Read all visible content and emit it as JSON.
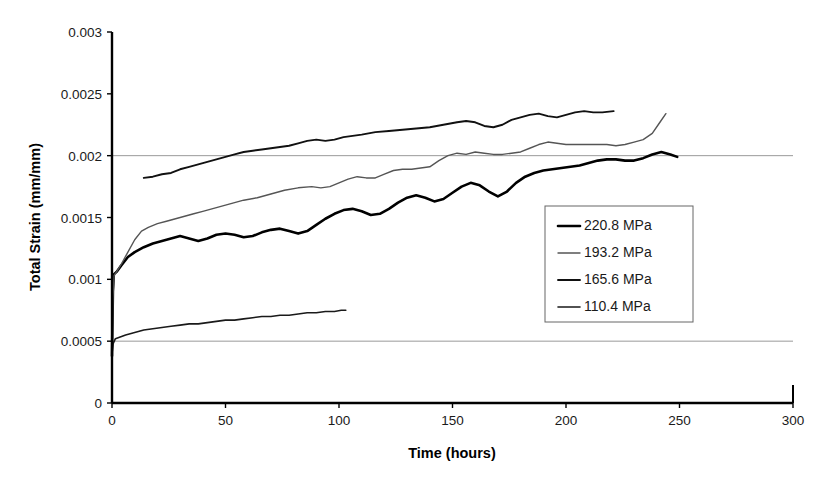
{
  "chart_data": {
    "type": "line",
    "title": "",
    "xlabel": "Time (hours)",
    "ylabel": "Total Strain (mm/mm)",
    "xlim": [
      0,
      300
    ],
    "ylim": [
      0,
      0.003
    ],
    "xticks": [
      0,
      50,
      100,
      150,
      200,
      250,
      300
    ],
    "xtick_labels": [
      "0",
      "50",
      "100",
      "150",
      "200",
      "250",
      "300"
    ],
    "yticks": [
      0,
      0.0005,
      0.001,
      0.0015,
      0.002,
      0.0025,
      0.003
    ],
    "ytick_labels": [
      "0",
      "0.0005",
      "0.001",
      "0.0015",
      "0.002",
      "0.0025",
      "0.003"
    ],
    "grid": "horizontal gridlines at 0.0005 and 0.002 only",
    "grid_values": [
      0.0005,
      0.002
    ],
    "legend_position": "inside lower-right",
    "series": [
      {
        "name": "220.8 MPa",
        "color": "#000000",
        "width": 2.6,
        "points": [
          [
            0,
            0.00038
          ],
          [
            0.4,
            0.0009
          ],
          [
            0.8,
            0.00104
          ],
          [
            2,
            0.00106
          ],
          [
            4,
            0.00111
          ],
          [
            7,
            0.00118
          ],
          [
            10,
            0.00122
          ],
          [
            14,
            0.00126
          ],
          [
            18,
            0.00129
          ],
          [
            22,
            0.00131
          ],
          [
            26,
            0.00133
          ],
          [
            30,
            0.00135
          ],
          [
            34,
            0.00133
          ],
          [
            38,
            0.00131
          ],
          [
            42,
            0.00133
          ],
          [
            46,
            0.00136
          ],
          [
            50,
            0.00137
          ],
          [
            54,
            0.00136
          ],
          [
            58,
            0.00134
          ],
          [
            62,
            0.00135
          ],
          [
            66,
            0.00138
          ],
          [
            70,
            0.0014
          ],
          [
            74,
            0.00141
          ],
          [
            78,
            0.00139
          ],
          [
            82,
            0.00137
          ],
          [
            86,
            0.00139
          ],
          [
            90,
            0.00144
          ],
          [
            94,
            0.00149
          ],
          [
            98,
            0.00153
          ],
          [
            102,
            0.00156
          ],
          [
            106,
            0.00157
          ],
          [
            110,
            0.00155
          ],
          [
            114,
            0.00152
          ],
          [
            118,
            0.00153
          ],
          [
            122,
            0.00157
          ],
          [
            126,
            0.00162
          ],
          [
            130,
            0.00166
          ],
          [
            134,
            0.00168
          ],
          [
            138,
            0.00166
          ],
          [
            142,
            0.00163
          ],
          [
            146,
            0.00165
          ],
          [
            150,
            0.0017
          ],
          [
            154,
            0.00175
          ],
          [
            158,
            0.00178
          ],
          [
            162,
            0.00176
          ],
          [
            166,
            0.00171
          ],
          [
            170,
            0.00167
          ],
          [
            174,
            0.00171
          ],
          [
            178,
            0.00178
          ],
          [
            182,
            0.00183
          ],
          [
            186,
            0.00186
          ],
          [
            190,
            0.00188
          ],
          [
            194,
            0.00189
          ],
          [
            198,
            0.0019
          ],
          [
            202,
            0.00191
          ],
          [
            206,
            0.00192
          ],
          [
            210,
            0.00194
          ],
          [
            214,
            0.00196
          ],
          [
            218,
            0.00197
          ],
          [
            222,
            0.00197
          ],
          [
            226,
            0.00196
          ],
          [
            230,
            0.00196
          ],
          [
            234,
            0.00198
          ],
          [
            238,
            0.00201
          ],
          [
            242,
            0.00203
          ],
          [
            246,
            0.00201
          ],
          [
            249,
            0.00199
          ]
        ]
      },
      {
        "name": "193.2 MPa",
        "color": "#555555",
        "width": 1.4,
        "points": [
          [
            0,
            0.00035
          ],
          [
            0.4,
            0.00085
          ],
          [
            0.9,
            0.00103
          ],
          [
            2,
            0.00106
          ],
          [
            4,
            0.00112
          ],
          [
            7,
            0.00122
          ],
          [
            10,
            0.00132
          ],
          [
            13,
            0.00139
          ],
          [
            16,
            0.00142
          ],
          [
            20,
            0.00145
          ],
          [
            24,
            0.00147
          ],
          [
            28,
            0.00149
          ],
          [
            32,
            0.00151
          ],
          [
            36,
            0.00153
          ],
          [
            40,
            0.00155
          ],
          [
            46,
            0.00158
          ],
          [
            52,
            0.00161
          ],
          [
            58,
            0.00164
          ],
          [
            64,
            0.00166
          ],
          [
            70,
            0.00169
          ],
          [
            76,
            0.00172
          ],
          [
            82,
            0.00174
          ],
          [
            88,
            0.00175
          ],
          [
            92,
            0.00174
          ],
          [
            96,
            0.00175
          ],
          [
            100,
            0.00178
          ],
          [
            104,
            0.00181
          ],
          [
            108,
            0.00183
          ],
          [
            112,
            0.00182
          ],
          [
            116,
            0.00182
          ],
          [
            120,
            0.00185
          ],
          [
            124,
            0.00188
          ],
          [
            128,
            0.00189
          ],
          [
            132,
            0.00189
          ],
          [
            136,
            0.0019
          ],
          [
            140,
            0.00191
          ],
          [
            144,
            0.00196
          ],
          [
            148,
            0.002
          ],
          [
            152,
            0.00202
          ],
          [
            156,
            0.00201
          ],
          [
            160,
            0.00203
          ],
          [
            164,
            0.00202
          ],
          [
            168,
            0.00201
          ],
          [
            172,
            0.00201
          ],
          [
            176,
            0.00202
          ],
          [
            180,
            0.00203
          ],
          [
            184,
            0.00206
          ],
          [
            188,
            0.00209
          ],
          [
            192,
            0.00211
          ],
          [
            196,
            0.0021
          ],
          [
            200,
            0.00209
          ],
          [
            206,
            0.00209
          ],
          [
            212,
            0.00209
          ],
          [
            218,
            0.00209
          ],
          [
            222,
            0.00208
          ],
          [
            226,
            0.00209
          ],
          [
            230,
            0.00211
          ],
          [
            234,
            0.00213
          ],
          [
            238,
            0.00218
          ],
          [
            241,
            0.00226
          ],
          [
            244,
            0.00234
          ]
        ]
      },
      {
        "name": "165.6 MPa",
        "color": "#111111",
        "width": 1.9,
        "points": [
          [
            14,
            0.00182
          ],
          [
            18,
            0.00183
          ],
          [
            22,
            0.00185
          ],
          [
            26,
            0.00186
          ],
          [
            30,
            0.00189
          ],
          [
            34,
            0.00191
          ],
          [
            38,
            0.00193
          ],
          [
            42,
            0.00195
          ],
          [
            46,
            0.00197
          ],
          [
            50,
            0.00199
          ],
          [
            54,
            0.00201
          ],
          [
            58,
            0.00203
          ],
          [
            62,
            0.00204
          ],
          [
            66,
            0.00205
          ],
          [
            70,
            0.00206
          ],
          [
            74,
            0.00207
          ],
          [
            78,
            0.00208
          ],
          [
            82,
            0.0021
          ],
          [
            86,
            0.00212
          ],
          [
            90,
            0.00213
          ],
          [
            94,
            0.00212
          ],
          [
            98,
            0.00213
          ],
          [
            102,
            0.00215
          ],
          [
            106,
            0.00216
          ],
          [
            110,
            0.00217
          ],
          [
            116,
            0.00219
          ],
          [
            122,
            0.0022
          ],
          [
            128,
            0.00221
          ],
          [
            134,
            0.00222
          ],
          [
            140,
            0.00223
          ],
          [
            146,
            0.00225
          ],
          [
            152,
            0.00227
          ],
          [
            156,
            0.00228
          ],
          [
            160,
            0.00227
          ],
          [
            164,
            0.00224
          ],
          [
            168,
            0.00223
          ],
          [
            172,
            0.00225
          ],
          [
            176,
            0.00229
          ],
          [
            180,
            0.00231
          ],
          [
            184,
            0.00233
          ],
          [
            188,
            0.00234
          ],
          [
            192,
            0.00232
          ],
          [
            196,
            0.00231
          ],
          [
            200,
            0.00233
          ],
          [
            204,
            0.00235
          ],
          [
            208,
            0.00236
          ],
          [
            212,
            0.00235
          ],
          [
            216,
            0.00235
          ],
          [
            221,
            0.00236
          ]
        ]
      },
      {
        "name": "110.4 MPa",
        "color": "#1a1a1a",
        "width": 1.6,
        "points": [
          [
            0,
            0.0004
          ],
          [
            0.5,
            0.00048
          ],
          [
            1.5,
            0.00052
          ],
          [
            3,
            0.00053
          ],
          [
            6,
            0.00055
          ],
          [
            10,
            0.00057
          ],
          [
            14,
            0.00059
          ],
          [
            18,
            0.0006
          ],
          [
            22,
            0.00061
          ],
          [
            26,
            0.00062
          ],
          [
            30,
            0.00063
          ],
          [
            34,
            0.00064
          ],
          [
            38,
            0.00064
          ],
          [
            42,
            0.00065
          ],
          [
            46,
            0.00066
          ],
          [
            50,
            0.00067
          ],
          [
            54,
            0.00067
          ],
          [
            58,
            0.00068
          ],
          [
            62,
            0.00069
          ],
          [
            66,
            0.0007
          ],
          [
            70,
            0.0007
          ],
          [
            74,
            0.00071
          ],
          [
            78,
            0.00071
          ],
          [
            82,
            0.00072
          ],
          [
            86,
            0.00073
          ],
          [
            90,
            0.00073
          ],
          [
            94,
            0.00074
          ],
          [
            98,
            0.00074
          ],
          [
            101,
            0.00075
          ],
          [
            103,
            0.00075
          ]
        ]
      }
    ]
  },
  "axes": {
    "x_title": "Time (hours)",
    "y_title": "Total Strain (mm/mm)"
  },
  "legend": {
    "items": [
      {
        "label": "220.8 MPa"
      },
      {
        "label": "193.2 MPa"
      },
      {
        "label": "165.6 MPa"
      },
      {
        "label": "110.4 MPa"
      }
    ]
  }
}
